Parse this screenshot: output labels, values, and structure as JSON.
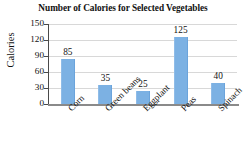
{
  "chart_data": {
    "type": "bar",
    "title": "Number of Calories for Selected Vegetables",
    "xlabel": "",
    "ylabel": "Calories",
    "categories": [
      "Corn",
      "Green beans",
      "Eggplant",
      "Peas",
      "Spinach"
    ],
    "values": [
      85,
      35,
      25,
      125,
      40
    ],
    "value_labels": [
      "85",
      "35",
      "25",
      "125",
      "40"
    ],
    "ylim": [
      0,
      150
    ],
    "yticks": [
      0,
      30,
      60,
      90,
      120,
      150
    ],
    "ytick_labels": [
      "0",
      "30",
      "60",
      "90",
      "120",
      "150"
    ],
    "grid": true,
    "legend": false,
    "bar_color": "#7cb1e3",
    "axis_color": "#4a4a4a",
    "grid_color": "#d8d8d8",
    "text_color": "#111111"
  }
}
